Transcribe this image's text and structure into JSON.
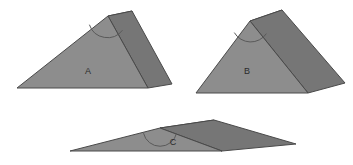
{
  "figure": {
    "background_color": "#ffffff",
    "colors": {
      "front_face": "#8d8d8d",
      "side_face": "#767676",
      "top_face": "#858585",
      "edge_stroke": "#4a4a4a",
      "arc_stroke": "#5a5a5a",
      "label_color": "#2b2b2b"
    }
  },
  "solids": [
    {
      "id": "solid-a",
      "label": "A",
      "label_position": {
        "x": 88,
        "y": 72
      },
      "apex_angle_description": "acute",
      "faces": {
        "front": "17,88 108,16 148,88",
        "side": "108,16 132,11 172,84 148,88",
        "top": "108,16 132,11 148,88"
      },
      "arc": {
        "cx": 108,
        "cy": 17,
        "r": 19,
        "path": "M 89.4,24.7 A 19,19 0 0 0 122.5,30.2"
      }
    },
    {
      "id": "solid-b",
      "label": "B",
      "label_position": {
        "x": 247,
        "y": 72
      },
      "apex_angle_description": "acute",
      "faces": {
        "front": "196,93 250,21 308,93",
        "side": "250,21 282,10 345,83 308,93",
        "top": "250,21 282,10 308,93"
      },
      "arc": {
        "cx": 250,
        "cy": 22,
        "r": 19,
        "path": "M 234.3,32.6 A 19,19 0 0 0 266.4,33.6"
      }
    },
    {
      "id": "solid-c",
      "label": "C",
      "label_position": {
        "x": 173,
        "y": 143
      },
      "apex_angle_description": "obtuse",
      "faces": {
        "front": "70,151 160,128 222,151",
        "side": "160,128 214,120 296,144 222,151",
        "top": "160,128 214,120 222,151"
      },
      "arc": {
        "cx": 160,
        "cy": 129,
        "r": 17,
        "path": "M 143.5,133.2 A 17,17 0 0 0 176.6,133.1"
      }
    }
  ]
}
